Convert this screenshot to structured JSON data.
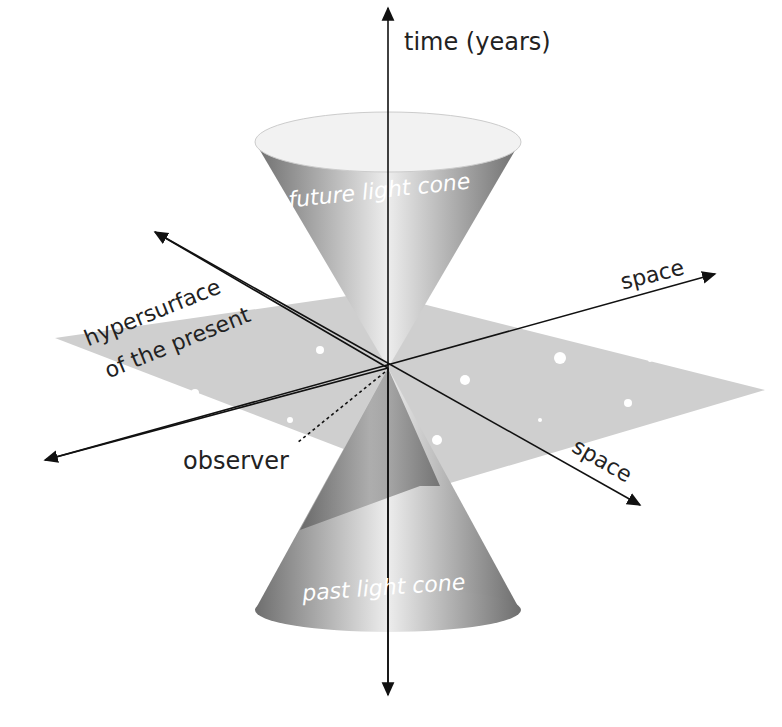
{
  "diagram": {
    "labels": {
      "time_axis": "time (years)",
      "space_axis_1": "space",
      "space_axis_2": "space",
      "future_cone": "future light cone",
      "past_cone": "past light cone",
      "hypersurface_line1": "hypersurface",
      "hypersurface_line2": "of the present",
      "observer": "observer"
    }
  }
}
